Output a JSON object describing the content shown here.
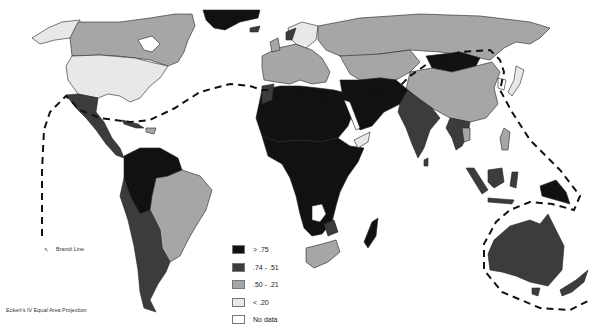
{
  "map": {
    "title": "World map of values by country with Brandt Line",
    "projection_label": "Eckert's IV Equal Area Projection",
    "brandt_line_label": "Brandt Line",
    "legend": [
      {
        "label": "> .75",
        "color": "#111111"
      },
      {
        "label": ".74 - .51",
        "color": "#3c3c3c"
      },
      {
        "label": ".50 - .21",
        "color": "#a6a6a6"
      },
      {
        "label": "< .20",
        "color": "#e8e8e8"
      },
      {
        "label": "No data",
        "color": "#ffffff"
      }
    ],
    "regions": {
      "canada": ".50 - .21",
      "usa": "< .20",
      "alaska": "< .20",
      "greenland": "> .75",
      "mexico": ".74 - .51",
      "central_america": ".74 - .51",
      "northern_south_america": "> .75",
      "brazil": ".50 - .21",
      "andes": ".74 - .51",
      "southern_cone": ".74 - .51",
      "western_europe": ".50 - .21",
      "scandinavia": "< .20",
      "russia": ".50 - .21",
      "north_africa": "> .75",
      "sub_saharan_africa": "> .75",
      "south_africa": ".50 - .21",
      "madagascar": "> .75",
      "middle_east": "> .75",
      "india": ".74 - .51",
      "china": ".50 - .21",
      "mongolia": "> .75",
      "japan": "< .20",
      "southeast_asia": ".74 - .51",
      "indonesia": ".74 - .51",
      "papua_new_guinea": "> .75",
      "australia": ".74 - .51",
      "new_zealand": ".74 - .51"
    }
  }
}
